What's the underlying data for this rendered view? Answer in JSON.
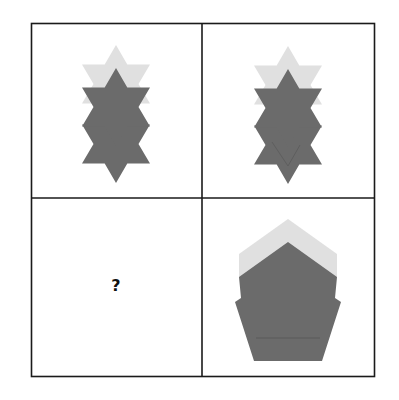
{
  "puzzle": {
    "title": "",
    "layout": "2x2 grid",
    "colors": {
      "border": "#1a1a1a",
      "background": "#ffffff",
      "light_shape": "#e0e0e0",
      "dark_shape": "#6b6b6b"
    },
    "panels": [
      {
        "position": "top-left",
        "content": "three overlapping six-pointed stars stacked vertically; top star light gray, two lower stars dark gray"
      },
      {
        "position": "top-right",
        "content": "three overlapping six-pointed stars stacked vertically; top star light gray, two lower stars dark gray"
      },
      {
        "position": "bottom-left",
        "content": "question mark",
        "label": "?"
      },
      {
        "position": "bottom-right",
        "content": "three overlapping pentagons stacked vertically; top pentagon light gray, two lower pentagons dark gray"
      }
    ]
  }
}
